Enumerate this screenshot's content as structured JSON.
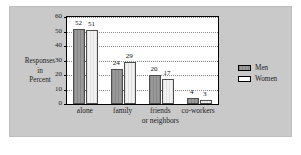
{
  "chart_data": {
    "type": "bar",
    "title": "",
    "xlabel": "",
    "ylabel": "Responses in Percent",
    "ylabel_lines": [
      "Responses",
      "in",
      "Percent"
    ],
    "categories": [
      "alone",
      "family",
      "friends or neighbors",
      "co-workers"
    ],
    "category_lines": [
      [
        "alone"
      ],
      [
        "family"
      ],
      [
        "friends",
        "or neighbors"
      ],
      [
        "co-workers"
      ]
    ],
    "series": [
      {
        "name": "Men",
        "values": [
          52,
          24,
          20,
          4
        ],
        "color": "#9a9a9a"
      },
      {
        "name": "Women",
        "values": [
          51,
          29,
          17,
          3
        ],
        "color": "#f2f2f2"
      }
    ],
    "ylim": [
      0,
      60
    ],
    "yticks": [
      0,
      10,
      20,
      30,
      40,
      50,
      60
    ],
    "ytick_labels": [
      "0",
      "10",
      "20",
      "30",
      "40",
      "50",
      "60"
    ],
    "grid": true,
    "grid_style": "dotted-horizontal",
    "legend_position": "right",
    "data_labels": true
  },
  "legend": {
    "items": [
      {
        "label": "Men"
      },
      {
        "label": "Women"
      }
    ]
  }
}
